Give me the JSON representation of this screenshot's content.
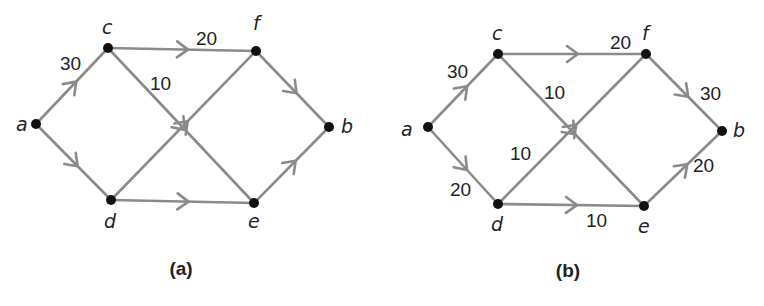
{
  "figure": {
    "panels": [
      {
        "id": "a",
        "caption": "(a)",
        "nodes": [
          {
            "id": "a",
            "label": "a",
            "x": 36,
            "y": 124,
            "lx": 16,
            "ly": 131
          },
          {
            "id": "c",
            "label": "c",
            "x": 108,
            "y": 48,
            "lx": 102,
            "ly": 34
          },
          {
            "id": "f",
            "label": "f",
            "x": 256,
            "y": 51,
            "lx": 253,
            "ly": 30
          },
          {
            "id": "b",
            "label": "b",
            "x": 329,
            "y": 127,
            "lx": 341,
            "ly": 133
          },
          {
            "id": "d",
            "label": "d",
            "x": 111,
            "y": 200,
            "lx": 104,
            "ly": 228
          },
          {
            "id": "e",
            "label": "e",
            "x": 254,
            "y": 203,
            "lx": 248,
            "ly": 228
          }
        ],
        "edges": [
          {
            "from": "a",
            "to": "c",
            "weight": "30",
            "wx": 60,
            "wy": 70
          },
          {
            "from": "a",
            "to": "d",
            "weight": ""
          },
          {
            "from": "c",
            "to": "f",
            "weight": "20",
            "wx": 196,
            "wy": 45
          },
          {
            "from": "c",
            "to": "e",
            "weight": "10",
            "wx": 150,
            "wy": 90
          },
          {
            "from": "d",
            "to": "f",
            "weight": ""
          },
          {
            "from": "d",
            "to": "e",
            "weight": ""
          },
          {
            "from": "f",
            "to": "b",
            "weight": ""
          },
          {
            "from": "e",
            "to": "b",
            "weight": ""
          }
        ],
        "caption_x": 181,
        "caption_y": 275
      },
      {
        "id": "b",
        "caption": "(b)",
        "nodes": [
          {
            "id": "a",
            "label": "a",
            "x": 428,
            "y": 127,
            "lx": 401,
            "ly": 136
          },
          {
            "id": "c",
            "label": "c",
            "x": 498,
            "y": 54,
            "lx": 492,
            "ly": 40
          },
          {
            "id": "f",
            "label": "f",
            "x": 646,
            "y": 54,
            "lx": 642,
            "ly": 40
          },
          {
            "id": "b",
            "label": "b",
            "x": 722,
            "y": 131,
            "lx": 733,
            "ly": 137
          },
          {
            "id": "d",
            "label": "d",
            "x": 498,
            "y": 204,
            "lx": 491,
            "ly": 231
          },
          {
            "id": "e",
            "label": "e",
            "x": 644,
            "y": 206,
            "lx": 638,
            "ly": 233
          }
        ],
        "edges": [
          {
            "from": "a",
            "to": "c",
            "weight": "30",
            "wx": 447,
            "wy": 78
          },
          {
            "from": "a",
            "to": "d",
            "weight": "20",
            "wx": 450,
            "wy": 196
          },
          {
            "from": "c",
            "to": "f",
            "weight": "20",
            "wx": 610,
            "wy": 49
          },
          {
            "from": "c",
            "to": "e",
            "weight": "10",
            "wx": 544,
            "wy": 99
          },
          {
            "from": "d",
            "to": "f",
            "weight": "10",
            "wx": 510,
            "wy": 160
          },
          {
            "from": "d",
            "to": "e",
            "weight": "10",
            "wx": 586,
            "wy": 227
          },
          {
            "from": "f",
            "to": "b",
            "weight": "30",
            "wx": 700,
            "wy": 100
          },
          {
            "from": "e",
            "to": "b",
            "weight": "20",
            "wx": 693,
            "wy": 172
          }
        ],
        "caption_x": 568,
        "caption_y": 277
      }
    ]
  }
}
